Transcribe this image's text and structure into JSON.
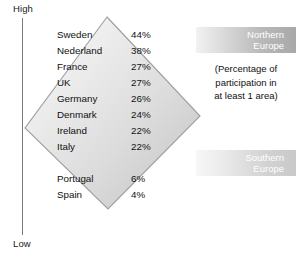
{
  "axis": {
    "high_label": "High",
    "low_label": "Low"
  },
  "banners": {
    "northern": {
      "line1": "Northern",
      "line2": "Europe"
    },
    "southern": {
      "line1": "Southern",
      "line2": "Europe"
    }
  },
  "note": {
    "line1": "(Percentage of",
    "line2": "participation in",
    "line3": "at least 1 area)"
  },
  "chart_data": {
    "type": "table",
    "title": "",
    "subtitle": "(Percentage of participation in at least 1 area)",
    "xlabel": "",
    "ylabel": "",
    "axis_top": "High",
    "axis_bottom": "Low",
    "group_labels": [
      "Northern Europe",
      "Southern Europe"
    ],
    "categories": [
      "Sweden",
      "Nederland",
      "France",
      "UK",
      "Germany",
      "Denmark",
      "Ireland",
      "Italy",
      "Portugal",
      "Spain"
    ],
    "values": [
      44,
      38,
      27,
      27,
      26,
      24,
      22,
      22,
      6,
      4
    ],
    "value_labels": [
      "44%",
      "38%",
      "27%",
      "27%",
      "26%",
      "24%",
      "22%",
      "22%",
      "6%",
      "4%"
    ],
    "rows": [
      {
        "name": "Sweden",
        "value": "44%",
        "gap_before": false
      },
      {
        "name": "Nederland",
        "value": "38%",
        "gap_before": false
      },
      {
        "name": "France",
        "value": "27%",
        "gap_before": false
      },
      {
        "name": "UK",
        "value": "27%",
        "gap_before": false
      },
      {
        "name": "Germany",
        "value": "26%",
        "gap_before": false
      },
      {
        "name": "Denmark",
        "value": "24%",
        "gap_before": false
      },
      {
        "name": "Ireland",
        "value": "22%",
        "gap_before": false
      },
      {
        "name": "Italy",
        "value": "22%",
        "gap_before": false
      },
      {
        "name": "Portugal",
        "value": "6%",
        "gap_before": true
      },
      {
        "name": "Spain",
        "value": "4%",
        "gap_before": false
      }
    ],
    "colors": {
      "diamond_fill_light": "#f4f4f4",
      "diamond_fill_dark": "#c8c8c8",
      "diamond_stroke": "#9a9a9a",
      "axis": "#7a7a7a",
      "text": "#111111",
      "banner_text": "#ffffff"
    }
  }
}
